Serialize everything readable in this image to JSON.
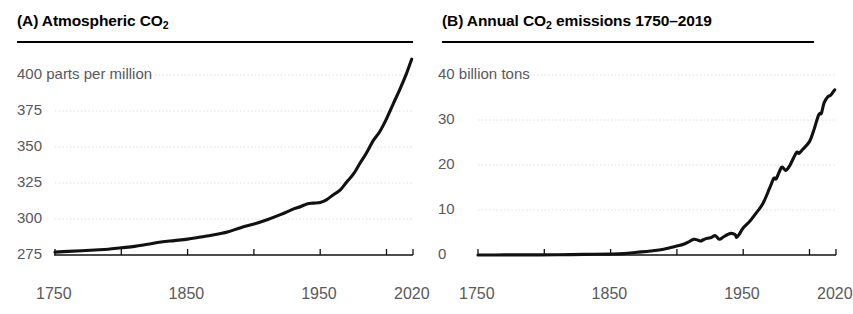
{
  "figure": {
    "background_color": "#ffffff",
    "line_color": "#111111",
    "tick_label_color": "#58595b",
    "grid_color": "#d8d8d8"
  },
  "panels": [
    {
      "key": "A",
      "label": "(A)",
      "title_main": "Atmospheric CO",
      "title_sub": "2",
      "title_tail": ""
    },
    {
      "key": "B",
      "label": "(B)",
      "title_main": "Annual CO",
      "title_sub": "2",
      "title_tail": " emissions 1750–2019"
    }
  ],
  "chart_data": [
    {
      "type": "line",
      "panel": "A",
      "title": "(A) Atmospheric CO2",
      "xlabel": "",
      "ylabel": "parts per million",
      "unit_label": "parts per million",
      "grid": true,
      "legend": null,
      "xlim": [
        1750,
        2020
      ],
      "ylim": [
        275,
        400
      ],
      "xticks": [
        1750,
        1800,
        1850,
        1900,
        1950,
        2000,
        2020
      ],
      "xtick_labels": [
        "1750",
        "",
        "1850",
        "",
        "1950",
        "",
        "2020"
      ],
      "yticks": [
        275,
        300,
        325,
        350,
        375,
        400
      ],
      "ytick_labels": [
        "275",
        "300",
        "325",
        "350",
        "375",
        "400 parts per million"
      ],
      "x": [
        1750,
        1760,
        1770,
        1780,
        1790,
        1800,
        1810,
        1820,
        1830,
        1840,
        1850,
        1860,
        1870,
        1880,
        1890,
        1900,
        1910,
        1920,
        1930,
        1935,
        1940,
        1945,
        1950,
        1955,
        1960,
        1965,
        1970,
        1975,
        1980,
        1985,
        1990,
        1995,
        2000,
        2005,
        2010,
        2015,
        2019
      ],
      "y": [
        277,
        277.5,
        278,
        278.5,
        279,
        280,
        281,
        282.5,
        284,
        285,
        286,
        287.5,
        289,
        291,
        294,
        296.5,
        299.5,
        303,
        307,
        308.5,
        310.5,
        311,
        311.5,
        313.5,
        316.9,
        320,
        325.7,
        331.1,
        338.7,
        346,
        354.4,
        360.8,
        369.5,
        379.8,
        389.9,
        400.8,
        411
      ]
    },
    {
      "type": "line",
      "panel": "B",
      "title": "(B) Annual CO2 emissions 1750–2019",
      "xlabel": "",
      "ylabel": "billion tons",
      "unit_label": "billion tons",
      "grid": true,
      "legend": null,
      "xlim": [
        1750,
        2020
      ],
      "ylim": [
        0,
        40
      ],
      "xticks": [
        1750,
        1800,
        1850,
        1900,
        1950,
        2000,
        2020
      ],
      "xtick_labels": [
        "1750",
        "",
        "1850",
        "",
        "1950",
        "",
        "2020"
      ],
      "yticks": [
        0,
        10,
        20,
        30,
        40
      ],
      "ytick_labels": [
        "0",
        "10",
        "20",
        "30",
        "40 billion tons"
      ],
      "x": [
        1750,
        1770,
        1790,
        1810,
        1830,
        1850,
        1860,
        1870,
        1880,
        1890,
        1900,
        1905,
        1910,
        1913,
        1916,
        1918,
        1920,
        1923,
        1926,
        1929,
        1932,
        1935,
        1938,
        1941,
        1944,
        1945,
        1947,
        1950,
        1955,
        1960,
        1965,
        1970,
        1973,
        1975,
        1979,
        1982,
        1985,
        1990,
        1992,
        1995,
        2000,
        2003,
        2007,
        2009,
        2011,
        2014,
        2016,
        2019
      ],
      "y": [
        0.01,
        0.02,
        0.03,
        0.05,
        0.13,
        0.2,
        0.3,
        0.6,
        0.9,
        1.3,
        2.0,
        2.4,
        3.1,
        3.5,
        3.3,
        3.1,
        3.4,
        3.7,
        3.9,
        4.3,
        3.5,
        4.0,
        4.5,
        4.8,
        4.5,
        3.9,
        4.6,
        6.0,
        7.5,
        9.4,
        11.5,
        14.9,
        17.0,
        17.0,
        19.5,
        18.8,
        19.8,
        22.7,
        22.6,
        23.5,
        25.2,
        27.5,
        31.2,
        31.5,
        33.8,
        35.2,
        35.5,
        36.7
      ]
    }
  ]
}
